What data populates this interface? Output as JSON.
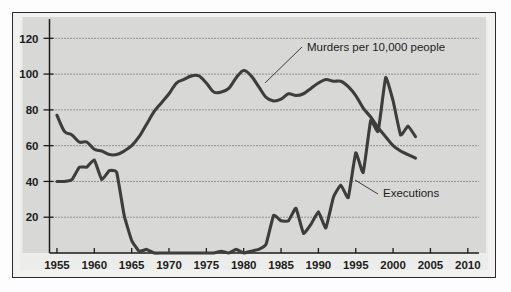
{
  "figure": {
    "kind": "line-chart-figure",
    "background_color": "#fdfdfd",
    "frame_color": "#2a2a2a",
    "plot_background_color": "#d8d8d6",
    "margin_background_color": "#ececea"
  },
  "chart_data": {
    "type": "line",
    "title": "",
    "subtitle": "",
    "xlabel": "",
    "ylabel": "",
    "xlim": [
      1954,
      2011.5
    ],
    "ylim": [
      0,
      128
    ],
    "xticks": [
      1955,
      1960,
      1965,
      1970,
      1975,
      1980,
      1985,
      1990,
      1995,
      2000,
      2005,
      2010
    ],
    "xticklabels": [
      "1955",
      "1960",
      "1965",
      "1970",
      "1975",
      "1980",
      "1985",
      "1990",
      "1995",
      "2000",
      "2005",
      "2010"
    ],
    "yticks": [
      20,
      40,
      60,
      80,
      100,
      120
    ],
    "yticklabels": [
      "20",
      "40",
      "60",
      "80",
      "100",
      "120"
    ],
    "grid": true,
    "grid_axis": "y",
    "grid_style": "dotted",
    "legend_position": "inline-annotations",
    "line_color": "#3d3d3d",
    "series": [
      {
        "name": "Murders per 10,000 people",
        "x": [
          1955,
          1956,
          1957,
          1958,
          1959,
          1960,
          1961,
          1962,
          1963,
          1964,
          1965,
          1966,
          1967,
          1968,
          1969,
          1970,
          1971,
          1972,
          1973,
          1974,
          1975,
          1976,
          1977,
          1978,
          1979,
          1980,
          1981,
          1982,
          1983,
          1984,
          1985,
          1986,
          1987,
          1988,
          1989,
          1990,
          1991,
          1992,
          1993,
          1994,
          1995,
          1996,
          1997,
          1998,
          1999,
          2000,
          2001,
          2002,
          2003
        ],
        "values": [
          77,
          68,
          66,
          62,
          62,
          58,
          57,
          55,
          55,
          57,
          60,
          65,
          72,
          79,
          84,
          89,
          95,
          97,
          99,
          99,
          95,
          90,
          90,
          92,
          98,
          102,
          99,
          93,
          87,
          85,
          86,
          89,
          88,
          89,
          92,
          95,
          97,
          96,
          96,
          93,
          88,
          81,
          76,
          70,
          65,
          60,
          57,
          55,
          53
        ],
        "color": "#3d3d3d",
        "annotation": {
          "text": "Murders per 10,000 people",
          "label_x": 2000,
          "label_y": 112,
          "anchor_x": 1980.5,
          "anchor_y": 100
        }
      },
      {
        "name": "Executions",
        "x": [
          1955,
          1956,
          1957,
          1958,
          1959,
          1960,
          1961,
          1962,
          1963,
          1964,
          1965,
          1966,
          1967,
          1968,
          1969,
          1970,
          1971,
          1972,
          1973,
          1974,
          1975,
          1976,
          1977,
          1978,
          1979,
          1980,
          1981,
          1982,
          1983,
          1984,
          1985,
          1986,
          1987,
          1988,
          1989,
          1990,
          1991,
          1992,
          1993,
          1994,
          1995,
          1996,
          1997,
          1998,
          1999,
          2000,
          2001,
          2002,
          2003
        ],
        "values": [
          40,
          40,
          41,
          48,
          48,
          52,
          41,
          46,
          45,
          21,
          7,
          1,
          2,
          0,
          0,
          0,
          0,
          0,
          0,
          0,
          0,
          0,
          1,
          0,
          2,
          0,
          1,
          2,
          5,
          21,
          18,
          18,
          25,
          11,
          16,
          23,
          14,
          31,
          38,
          31,
          56,
          45,
          74,
          68,
          98,
          85,
          66,
          71,
          65
        ],
        "color": "#3d3d3d",
        "annotation": {
          "text": "Executions",
          "label_x": 1998.5,
          "label_y": 36,
          "anchor_x": 1994.5,
          "anchor_y": 50
        }
      }
    ]
  },
  "annotations": {
    "murders_label": "Murders per 10,000 people",
    "executions_label": "Executions"
  }
}
